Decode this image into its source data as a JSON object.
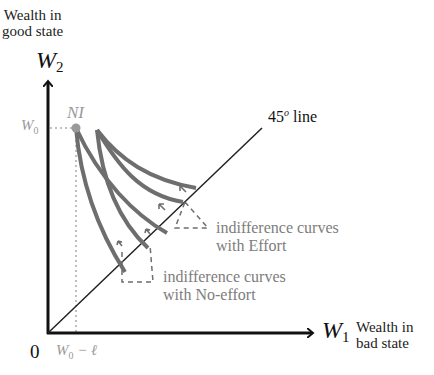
{
  "diagram": {
    "y_axis": {
      "title_line1": "Wealth in",
      "title_line2": "good state",
      "var": "W",
      "sub": "2"
    },
    "x_axis": {
      "title_line1": "Wealth in",
      "title_line2": "bad state",
      "var": "W",
      "sub": "1"
    },
    "origin_label": "0",
    "diag_label": "45",
    "diag_label_sup": "o",
    "diag_label_suffix": " line",
    "ni_label": "NI",
    "w0_label": "W",
    "w0_sub": "0",
    "w0_minus_l_label": "W",
    "w0_minus_l_sub": "0",
    "w0_minus_l_suffix": " − ℓ",
    "annotations": {
      "effort_line1": "indifference curves",
      "effort_line2": "with Effort",
      "noeffort_line1": "indifference curves",
      "noeffort_line2": "with No-effort"
    },
    "colors": {
      "axis": "#111111",
      "curve": "#6e6e6e",
      "label_gray": "#9a9a9a",
      "annotation": "#7d7d7d",
      "dashed": "#6e6e6e"
    }
  }
}
